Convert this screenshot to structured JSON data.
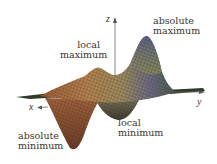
{
  "figure": {
    "type": "3d-surface-plot",
    "axes": {
      "x": "x",
      "y": "y",
      "z": "z"
    },
    "annotations": {
      "absolute_maximum": [
        "absolute",
        "maximum"
      ],
      "local_maximum": [
        "local",
        "maximum"
      ],
      "local_minimum": [
        "local",
        "minimum"
      ],
      "absolute_minimum": [
        "absolute",
        "minimum"
      ]
    },
    "colors": {
      "surface_warm": "#b0703f",
      "surface_mid": "#8a7a56",
      "surface_cool": "#5e6a86",
      "mesh_lines": "#2b2a26",
      "axis": "#555555",
      "text": "#3a3630"
    }
  }
}
